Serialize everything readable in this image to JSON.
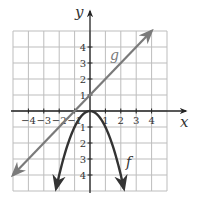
{
  "chart_data": {
    "type": "line",
    "title": "",
    "xlabel": "x",
    "ylabel": "y",
    "xlim": [
      -5,
      5
    ],
    "ylim": [
      -5,
      5
    ],
    "grid": true,
    "x_ticks": [
      -4,
      -3,
      -2,
      -1,
      1,
      2,
      3,
      4
    ],
    "y_ticks": [
      -4,
      -3,
      -2,
      -1,
      1,
      2,
      3,
      4
    ],
    "x_tick_labels": [
      "−4",
      "−3",
      "−2",
      "−1",
      "1",
      "2",
      "3",
      "4"
    ],
    "y_tick_labels": [
      "−4",
      "−3",
      "−2",
      "−1",
      "1",
      "2",
      "3",
      "4"
    ],
    "series": [
      {
        "name": "g",
        "equation": "g(x) = x + 1",
        "kind": "line",
        "color": "#7a7a7a",
        "x": [
          -5,
          4
        ],
        "y": [
          -4,
          5
        ],
        "arrows": "both"
      },
      {
        "name": "f",
        "equation": "f(x) = -x^2",
        "kind": "parabola",
        "color": "#333333",
        "x": [
          -2.2,
          -2,
          -1,
          0,
          1,
          2,
          2.2
        ],
        "y": [
          -4.84,
          -4,
          -1,
          0,
          -1,
          -4,
          -4.84
        ],
        "vertex": [
          0,
          0
        ],
        "arrows": "both"
      }
    ],
    "annotations": [
      {
        "text": "g",
        "x": 1.4,
        "y": 3.4
      },
      {
        "text": "f",
        "x": 2.45,
        "y": -3.4
      }
    ]
  },
  "labels": {
    "x_axis": "x",
    "y_axis": "y",
    "g": "g",
    "f": "f"
  }
}
